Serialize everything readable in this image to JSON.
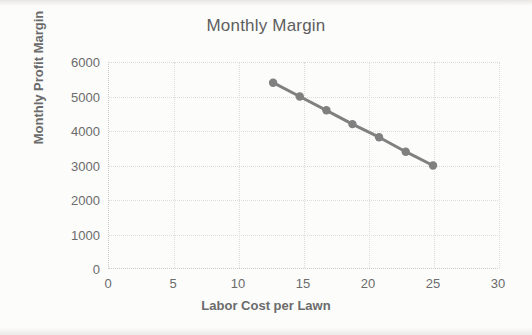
{
  "chart_data": {
    "type": "line",
    "title": "Monthly Margin",
    "xlabel": "Labor Cost per Lawn",
    "ylabel": "Monthly Profit Margin",
    "xlim": [
      0,
      30
    ],
    "ylim": [
      0,
      6000
    ],
    "xticks": [
      0,
      5,
      10,
      15,
      20,
      25,
      30
    ],
    "yticks": [
      0,
      1000,
      2000,
      3000,
      4000,
      5000,
      6000
    ],
    "xtick_labels": [
      "0",
      "5",
      "10",
      "15",
      "20",
      "25",
      "30"
    ],
    "ytick_labels": [
      "0",
      "1000",
      "2000",
      "3000",
      "4000",
      "5000",
      "6000"
    ],
    "grid": true,
    "legend": "none",
    "series": [
      {
        "name": "Monthly Profit Margin",
        "color": "#808080",
        "marker": "circle",
        "x": [
          12.7,
          14.75,
          16.8,
          18.8,
          20.85,
          22.9,
          25.0
        ],
        "y": [
          5400,
          5000,
          4600,
          4200,
          3820,
          3400,
          3000
        ],
        "points": [
          {
            "x": 12.7,
            "y": 5400
          },
          {
            "x": 14.75,
            "y": 5000
          },
          {
            "x": 16.8,
            "y": 4600
          },
          {
            "x": 18.8,
            "y": 4200
          },
          {
            "x": 20.85,
            "y": 3820
          },
          {
            "x": 22.9,
            "y": 3400
          },
          {
            "x": 25.0,
            "y": 3000
          }
        ]
      }
    ]
  },
  "colors": {
    "series": "#808080",
    "grid": "#dcdcdc",
    "axis": "#c9c9c9",
    "text": "#6b6b6b",
    "title": "#5e5e5e",
    "background": "#fcfcfb"
  }
}
